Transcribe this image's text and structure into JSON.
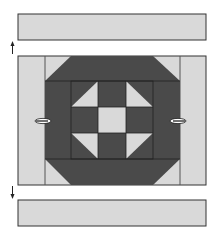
{
  "diagram": {
    "title": "Quilt block assembly: add top and bottom border strips",
    "colors": {
      "light": "#d9d9d9",
      "dark": "#4a4a4a",
      "outline": "#333333",
      "background": "#ffffff"
    },
    "top_strip": {
      "x": 18,
      "y": 14,
      "w": 188,
      "h": 26
    },
    "bottom_strip": {
      "x": 18,
      "y": 200,
      "w": 188,
      "h": 26
    },
    "block": {
      "x": 18,
      "y": 56,
      "w": 188,
      "h": 129
    },
    "arrows": [
      {
        "name": "up-arrow",
        "direction": "up"
      },
      {
        "name": "down-arrow",
        "direction": "down"
      }
    ],
    "pins": [
      {
        "name": "left-pin"
      },
      {
        "name": "right-pin"
      }
    ]
  }
}
